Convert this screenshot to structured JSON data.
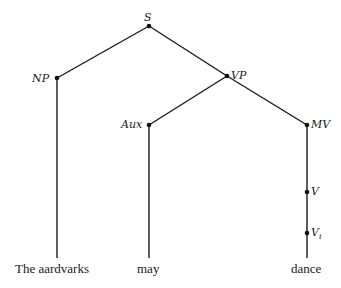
{
  "diagram": {
    "type": "syntax-tree",
    "nodes": {
      "S": "S",
      "NP": "NP",
      "VP": "VP",
      "Aux": "Aux",
      "MV": "MV",
      "V": "V",
      "Vi_base": "V",
      "Vi_sub": "i"
    },
    "words": {
      "subject": "The aardvarks",
      "aux": "may",
      "verb": "dance"
    },
    "edges": [
      [
        "S",
        "NP"
      ],
      [
        "S",
        "VP"
      ],
      [
        "NP",
        "The aardvarks"
      ],
      [
        "VP",
        "Aux"
      ],
      [
        "VP",
        "MV"
      ],
      [
        "Aux",
        "may"
      ],
      [
        "MV",
        "V"
      ],
      [
        "V",
        "Vi"
      ],
      [
        "Vi",
        "dance"
      ]
    ]
  }
}
